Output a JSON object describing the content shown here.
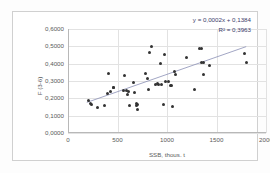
{
  "chart_data": {
    "type": "scatter",
    "title": "",
    "xlabel": "SSB, thous. t",
    "ylabel": "F (3-6)",
    "xlim": [
      0,
      2000
    ],
    "ylim": [
      0.0,
      0.6
    ],
    "xticks": [
      "0",
      "500",
      "1000",
      "1500",
      "2000"
    ],
    "xtick_values": [
      0,
      500,
      1000,
      1500,
      2000
    ],
    "yticks": [
      "0,0000",
      "0,1000",
      "0,2000",
      "0,3000",
      "0,4000",
      "0,5000",
      "0,6000"
    ],
    "ytick_values": [
      0.0,
      0.1,
      0.2,
      0.3,
      0.4,
      0.5,
      0.6
    ],
    "grid": true,
    "legend": "none",
    "annotations": {
      "equation": "y = 0,0002x + 0,1384",
      "r_squared": "R² = 0,3963"
    },
    "trendline": {
      "type": "linear",
      "slope": 0.0002,
      "intercept": 0.1384,
      "x_start": 190,
      "x_end": 1800
    },
    "points": [
      {
        "x": 205,
        "y": 0.186
      },
      {
        "x": 232,
        "y": 0.168
      },
      {
        "x": 240,
        "y": 0.163
      },
      {
        "x": 300,
        "y": 0.145
      },
      {
        "x": 370,
        "y": 0.157
      },
      {
        "x": 395,
        "y": 0.228
      },
      {
        "x": 405,
        "y": 0.345
      },
      {
        "x": 430,
        "y": 0.238
      },
      {
        "x": 455,
        "y": 0.262
      },
      {
        "x": 460,
        "y": 0.262
      },
      {
        "x": 560,
        "y": 0.246
      },
      {
        "x": 575,
        "y": 0.331
      },
      {
        "x": 590,
        "y": 0.243
      },
      {
        "x": 600,
        "y": 0.222
      },
      {
        "x": 610,
        "y": 0.238
      },
      {
        "x": 625,
        "y": 0.16
      },
      {
        "x": 660,
        "y": 0.292
      },
      {
        "x": 672,
        "y": 0.232
      },
      {
        "x": 690,
        "y": 0.169
      },
      {
        "x": 694,
        "y": 0.158
      },
      {
        "x": 700,
        "y": 0.164
      },
      {
        "x": 705,
        "y": 0.135
      },
      {
        "x": 780,
        "y": 0.344
      },
      {
        "x": 800,
        "y": 0.315
      },
      {
        "x": 810,
        "y": 0.249
      },
      {
        "x": 820,
        "y": 0.462
      },
      {
        "x": 845,
        "y": 0.497
      },
      {
        "x": 880,
        "y": 0.281
      },
      {
        "x": 900,
        "y": 0.287
      },
      {
        "x": 915,
        "y": 0.279
      },
      {
        "x": 930,
        "y": 0.4
      },
      {
        "x": 945,
        "y": 0.282
      },
      {
        "x": 960,
        "y": 0.166
      },
      {
        "x": 975,
        "y": 0.452
      },
      {
        "x": 985,
        "y": 0.296
      },
      {
        "x": 1020,
        "y": 0.298
      },
      {
        "x": 1035,
        "y": 0.272
      },
      {
        "x": 1045,
        "y": 0.272
      },
      {
        "x": 1055,
        "y": 0.151
      },
      {
        "x": 1075,
        "y": 0.352
      },
      {
        "x": 1090,
        "y": 0.339
      },
      {
        "x": 1200,
        "y": 0.434
      },
      {
        "x": 1280,
        "y": 0.249
      },
      {
        "x": 1330,
        "y": 0.486
      },
      {
        "x": 1345,
        "y": 0.487
      },
      {
        "x": 1350,
        "y": 0.406
      },
      {
        "x": 1365,
        "y": 0.409
      },
      {
        "x": 1370,
        "y": 0.337
      },
      {
        "x": 1430,
        "y": 0.389
      },
      {
        "x": 1780,
        "y": 0.458
      },
      {
        "x": 1800,
        "y": 0.409
      }
    ]
  }
}
